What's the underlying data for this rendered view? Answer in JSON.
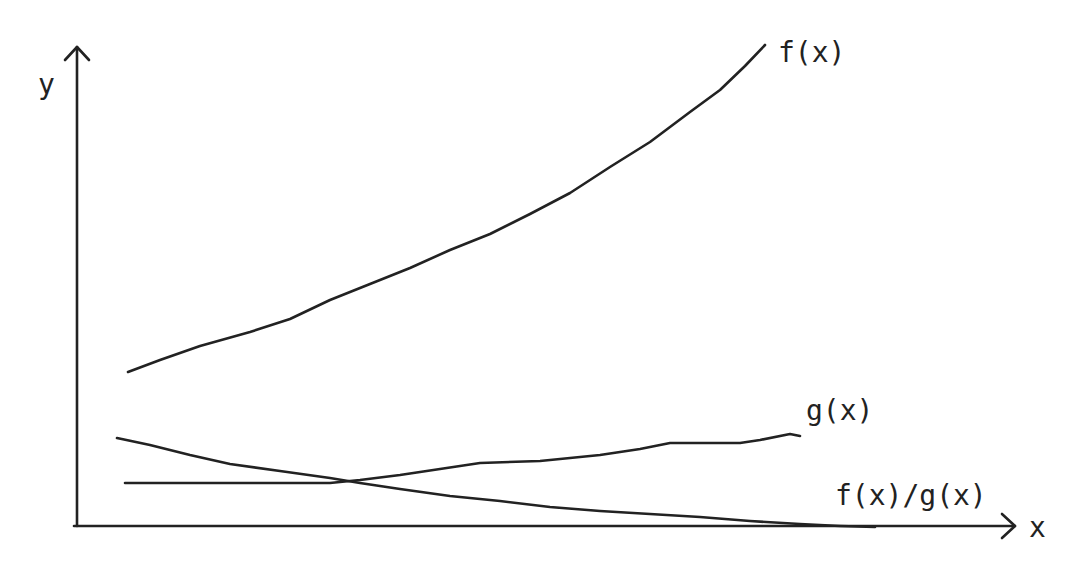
{
  "diagram": {
    "axes": {
      "x_label": "x",
      "y_label": "y",
      "origin_px": [
        77,
        526
      ],
      "x_arrow_tip_px": [
        1015,
        526
      ],
      "y_arrow_tip_px": [
        77,
        47
      ]
    },
    "curves": [
      {
        "id": "f",
        "label": "f(x)",
        "label_pos": [
          778,
          62
        ],
        "description": "increasing convex curve",
        "points": [
          [
            128,
            372
          ],
          [
            160,
            360
          ],
          [
            200,
            346
          ],
          [
            250,
            332
          ],
          [
            290,
            319
          ],
          [
            330,
            300
          ],
          [
            370,
            284
          ],
          [
            410,
            268
          ],
          [
            450,
            250
          ],
          [
            490,
            234
          ],
          [
            530,
            214
          ],
          [
            570,
            193
          ],
          [
            610,
            167
          ],
          [
            650,
            142
          ],
          [
            690,
            112
          ],
          [
            720,
            90
          ],
          [
            745,
            66
          ],
          [
            765,
            45
          ]
        ]
      },
      {
        "id": "g",
        "label": "g(x)",
        "label_pos": [
          806,
          420
        ],
        "description": "flat then slowly increasing",
        "points": [
          [
            125,
            483
          ],
          [
            330,
            483
          ],
          [
            360,
            480
          ],
          [
            400,
            475
          ],
          [
            440,
            469
          ],
          [
            480,
            463
          ],
          [
            540,
            461
          ],
          [
            600,
            455
          ],
          [
            640,
            449
          ],
          [
            670,
            443
          ],
          [
            740,
            443
          ],
          [
            760,
            440
          ],
          [
            790,
            434
          ],
          [
            800,
            436
          ]
        ]
      },
      {
        "id": "fg",
        "label": "f(x)/g(x)",
        "label_pos": [
          835,
          505
        ],
        "description": "decreasing curve approaching x-axis",
        "points": [
          [
            117,
            438
          ],
          [
            150,
            445
          ],
          [
            190,
            455
          ],
          [
            230,
            464
          ],
          [
            280,
            471
          ],
          [
            330,
            478
          ],
          [
            360,
            483
          ],
          [
            400,
            489
          ],
          [
            450,
            496
          ],
          [
            500,
            501
          ],
          [
            550,
            507
          ],
          [
            600,
            511
          ],
          [
            650,
            514
          ],
          [
            700,
            517
          ],
          [
            750,
            521
          ],
          [
            800,
            524
          ],
          [
            840,
            526
          ],
          [
            875,
            527
          ]
        ]
      }
    ]
  }
}
